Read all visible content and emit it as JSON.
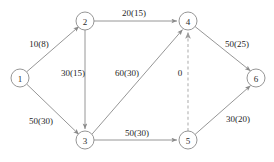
{
  "diagram": {
    "type": "network-graph",
    "colors": {
      "edge": "#8a8a8a",
      "edge_dashed": "#b2b2b2",
      "node_stroke": "#8a8a8a",
      "node_fill": "#ffffff",
      "text": "#1f1f1f",
      "background": "#ffffff"
    },
    "nodes": [
      {
        "id": "1",
        "label": "1",
        "x": 20,
        "y": 78,
        "r": 9
      },
      {
        "id": "2",
        "label": "2",
        "x": 85,
        "y": 21,
        "r": 9
      },
      {
        "id": "3",
        "label": "3",
        "x": 85,
        "y": 140,
        "r": 9
      },
      {
        "id": "4",
        "label": "4",
        "x": 188,
        "y": 21,
        "r": 9
      },
      {
        "id": "5",
        "label": "5",
        "x": 188,
        "y": 140,
        "r": 9
      },
      {
        "id": "6",
        "label": "6",
        "x": 256,
        "y": 78,
        "r": 9
      }
    ],
    "edges": [
      {
        "id": "e1-2",
        "from": "1",
        "to": "2",
        "label": "10(8)",
        "style": "solid",
        "arrow": "end",
        "label_x": 39,
        "label_y": 44
      },
      {
        "id": "e1-3",
        "from": "1",
        "to": "3",
        "label": "50(30)",
        "style": "solid",
        "arrow": "end",
        "label_x": 41,
        "label_y": 121
      },
      {
        "id": "e2-4",
        "from": "2",
        "to": "4",
        "label": "20(15)",
        "style": "solid",
        "arrow": "end",
        "label_x": 134,
        "label_y": 13
      },
      {
        "id": "e2-3",
        "from": "2",
        "to": "3",
        "label": "30(15)",
        "style": "solid",
        "arrow": "end",
        "label_x": 73,
        "label_y": 73
      },
      {
        "id": "e3-4",
        "from": "3",
        "to": "4",
        "label": "60(30)",
        "style": "solid",
        "arrow": "end",
        "label_x": 127,
        "label_y": 73
      },
      {
        "id": "e3-5",
        "from": "3",
        "to": "5",
        "label": "50(30)",
        "style": "solid",
        "arrow": "end",
        "label_x": 137,
        "label_y": 133
      },
      {
        "id": "e4-6",
        "from": "4",
        "to": "6",
        "label": "50(25)",
        "style": "solid",
        "arrow": "end",
        "label_x": 237,
        "label_y": 44
      },
      {
        "id": "e5-6",
        "from": "5",
        "to": "6",
        "label": "30(20)",
        "style": "solid",
        "arrow": "end",
        "label_x": 238,
        "label_y": 119
      },
      {
        "id": "e5-4",
        "from": "5",
        "to": "4",
        "label": "0",
        "style": "dashed",
        "arrow": "end",
        "label_x": 180,
        "label_y": 73
      }
    ]
  }
}
